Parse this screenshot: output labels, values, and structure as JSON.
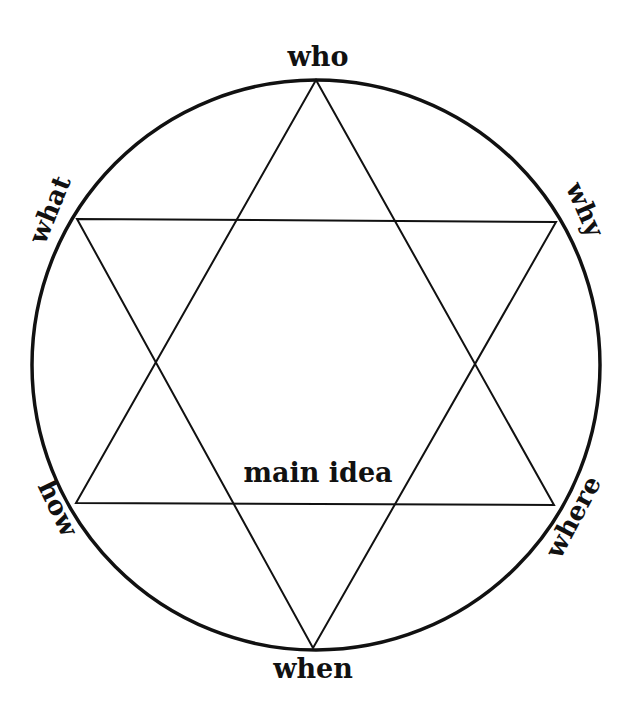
{
  "diagram": {
    "center_label": "main idea",
    "vertices": [
      {
        "id": "who",
        "label": "who"
      },
      {
        "id": "why",
        "label": "why"
      },
      {
        "id": "where",
        "label": "where"
      },
      {
        "id": "when",
        "label": "when"
      },
      {
        "id": "how",
        "label": "how"
      },
      {
        "id": "what",
        "label": "what"
      }
    ],
    "colors": {
      "stroke": "#111111",
      "background": "#ffffff"
    }
  }
}
